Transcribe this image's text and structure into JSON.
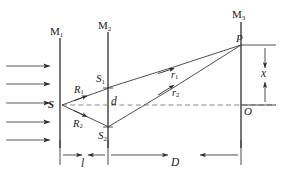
{
  "figure": {
    "kind": "optics-ray-diagram",
    "background_color": "#ffffff",
    "line_color": "#3a3a3a",
    "text_color": "#1a1a1a"
  },
  "screens": [
    {
      "name": "M1",
      "label_main": "M",
      "label_sub": "1",
      "x": 60
    },
    {
      "name": "M2",
      "label_main": "M",
      "label_sub": "2",
      "x": 108
    },
    {
      "name": "M3",
      "label_main": "M",
      "label_sub": "3",
      "x": 241
    }
  ],
  "points": [
    {
      "name": "S",
      "label_main": "S",
      "label_sub": "",
      "x": 62,
      "y": 105
    },
    {
      "name": "S1",
      "label_main": "S",
      "label_sub": "1",
      "x": 108,
      "y": 88
    },
    {
      "name": "S2",
      "label_main": "S",
      "label_sub": "2",
      "x": 108,
      "y": 127
    },
    {
      "name": "P",
      "label_main": "P",
      "label_sub": "",
      "x": 241,
      "y": 45
    },
    {
      "name": "O",
      "label_main": "O",
      "label_sub": "",
      "x": 241,
      "y": 105
    }
  ],
  "rays": [
    {
      "name": "R1",
      "label_main": "R",
      "label_sub": "1",
      "from": "S",
      "to": "S1"
    },
    {
      "name": "R2",
      "label_main": "R",
      "label_sub": "2",
      "from": "S",
      "to": "S2"
    },
    {
      "name": "r1",
      "label_main": "r",
      "label_sub": "1",
      "from": "S1",
      "to": "P"
    },
    {
      "name": "r2",
      "label_main": "r",
      "label_sub": "2",
      "from": "S2",
      "to": "P"
    }
  ],
  "dimensions": [
    {
      "name": "d",
      "label_main": "d",
      "label_sub": "",
      "orientation": "vertical",
      "note": "separation between S1 and S2 on M2"
    },
    {
      "name": "x",
      "label_main": "x",
      "label_sub": "",
      "orientation": "vertical",
      "note": "distance from O up to P on M3"
    },
    {
      "name": "l",
      "label_main": "l",
      "label_sub": "",
      "orientation": "horizontal",
      "note": "distance from M1 to M2"
    },
    {
      "name": "D",
      "label_main": "D",
      "label_sub": "",
      "orientation": "horizontal",
      "note": "distance from M2 to M3"
    }
  ],
  "incident_beam": {
    "name": "incident-plane-wave",
    "arrow_count": 5,
    "direction": "left-to-right",
    "arrow_y": [
      66,
      84,
      103,
      122,
      140
    ],
    "x_start": 6,
    "x_end": 52
  },
  "axis": {
    "name": "optical-axis",
    "style": "dashed",
    "y": 105,
    "x_start": 62,
    "x_end": 276
  }
}
